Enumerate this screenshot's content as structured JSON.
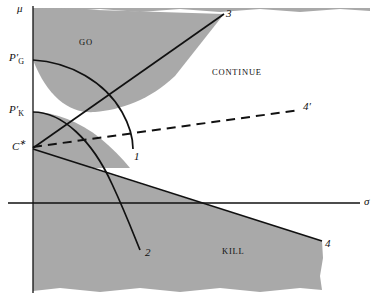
{
  "figure": {
    "background_color": "#ffffff",
    "shade_color": "#a9a9a9",
    "line_color": "#111111"
  },
  "axes": {
    "y_axis_label": "μ",
    "x_axis_label": "σ",
    "y_ticks": [
      {
        "name": "P-prime-G",
        "base": "P",
        "prime": "′",
        "sub": "G",
        "y": 60
      },
      {
        "name": "P-prime-K",
        "base": "P",
        "prime": "′",
        "sub": "K",
        "y": 112
      },
      {
        "name": "C-star",
        "base": "C",
        "prime": "∗",
        "sub": "",
        "y": 146
      }
    ]
  },
  "regions": [
    {
      "id": "go",
      "label": "GO"
    },
    {
      "id": "continue",
      "label": "CONTINUE"
    },
    {
      "id": "kill",
      "label": "KILL"
    }
  ],
  "curves": [
    {
      "id": "curve-1",
      "label": "1",
      "style": "solid"
    },
    {
      "id": "curve-2",
      "label": "2",
      "style": "solid"
    },
    {
      "id": "curve-3",
      "label": "3",
      "style": "solid"
    },
    {
      "id": "curve-4",
      "label": "4",
      "style": "solid"
    },
    {
      "id": "curve-4-prime",
      "label": "4′",
      "style": "dashed"
    }
  ]
}
